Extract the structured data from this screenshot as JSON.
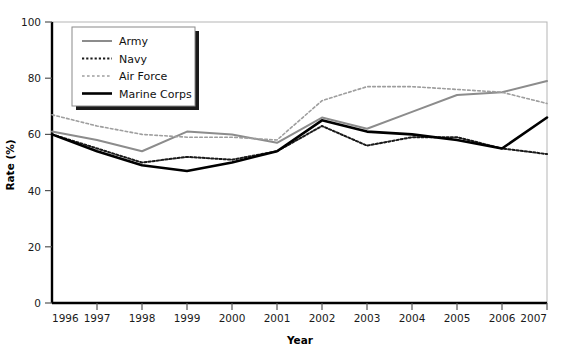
{
  "chart_data": {
    "type": "line",
    "title": "",
    "xlabel": "Year",
    "ylabel": "Rate (%)",
    "x": [
      1996,
      1997,
      1998,
      1999,
      2000,
      2001,
      2002,
      2003,
      2004,
      2005,
      2006,
      2007
    ],
    "categories": [
      "1996",
      "1997",
      "1998",
      "1999",
      "2000",
      "2001",
      "2002",
      "2003",
      "2004",
      "2005",
      "2006",
      "2007"
    ],
    "xlim": [
      1996,
      2007
    ],
    "ylim": [
      0,
      100
    ],
    "yticks": [
      0,
      20,
      40,
      60,
      80,
      100
    ],
    "ytick_labels": [
      "0",
      "20",
      "40",
      "60",
      "80",
      "100"
    ],
    "grid": false,
    "legend_position": "top-left",
    "series": [
      {
        "name": "Army",
        "values": [
          61,
          58,
          54,
          61,
          60,
          57,
          66,
          62,
          68,
          74,
          75,
          79
        ],
        "color": "#8c8c8c",
        "style": "solid",
        "width": 2.0
      },
      {
        "name": "Navy",
        "values": [
          60,
          55,
          50,
          52,
          51,
          54,
          63,
          56,
          59,
          59,
          55,
          53
        ],
        "color": "#1a1a1a",
        "style": "dotted",
        "width": 2.0
      },
      {
        "name": "Air Force",
        "values": [
          67,
          63,
          60,
          59,
          59,
          58,
          72,
          77,
          77,
          76,
          75,
          71
        ],
        "color": "#9e9e9e",
        "style": "dotted",
        "width": 1.6
      },
      {
        "name": "Marine Corps",
        "values": [
          60,
          54,
          49,
          47,
          50,
          54,
          65,
          61,
          60,
          58,
          55,
          66
        ],
        "color": "#000000",
        "style": "solid",
        "width": 2.6
      }
    ]
  },
  "legend": {
    "items": [
      {
        "label": "Army"
      },
      {
        "label": "Navy"
      },
      {
        "label": "Air Force"
      },
      {
        "label": "Marine Corps"
      }
    ]
  },
  "axes": {
    "x_title": "Year",
    "y_title": "Rate (%)"
  }
}
